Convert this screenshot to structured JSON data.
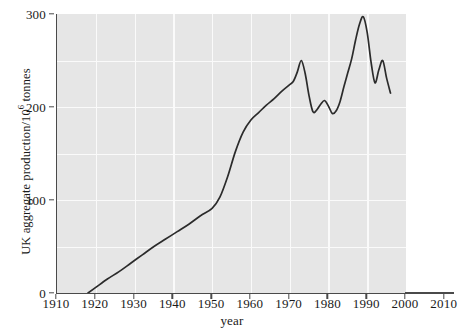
{
  "chart_data": {
    "type": "line",
    "title": "",
    "xlabel": "year",
    "ylabel": "UK aggregate production/10^6 tonnes",
    "ylabel_base": "UK aggregate production/10",
    "ylabel_exponent": "6",
    "ylabel_unit": " tonnes",
    "xlim": [
      1910,
      2010
    ],
    "ylim": [
      0,
      300
    ],
    "xticks": [
      1910,
      1920,
      1930,
      1940,
      1950,
      1960,
      1970,
      1980,
      1990,
      2000,
      2010
    ],
    "xtick_labels": [
      "1910",
      "1920",
      "1930",
      "1940",
      "1950",
      "1960",
      "1970",
      "1980",
      "1990",
      "2000",
      "2010"
    ],
    "yticks": [
      0,
      100,
      200,
      300
    ],
    "ytick_labels": [
      "0",
      "100",
      "200",
      "300"
    ],
    "y_gridlines": [
      50,
      100,
      150,
      200,
      250
    ],
    "x_gridlines": [
      1920,
      1930,
      1940,
      1950,
      1960,
      1970,
      1980,
      1990
    ],
    "plot_box_xrange": [
      1910,
      2000
    ],
    "grid": true,
    "legend": "none",
    "line_color": "#2b2b2b",
    "plot_background": "#e6e6e6",
    "gridline_color": "#fafafa",
    "axis_color": "#4a4a4a",
    "series": [
      {
        "name": "UK aggregate production",
        "x": [
          1918,
          1920,
          1923,
          1926,
          1929,
          1932,
          1935,
          1938,
          1941,
          1944,
          1947,
          1950,
          1952,
          1954,
          1956,
          1958,
          1960,
          1962,
          1964,
          1966,
          1968,
          1970,
          1971,
          1972,
          1973,
          1974,
          1975,
          1976,
          1977,
          1978,
          1979,
          1980,
          1981,
          1982,
          1983,
          1984,
          1985,
          1986,
          1987,
          1988,
          1989,
          1990,
          1991,
          1992,
          1993,
          1994,
          1995,
          1996
        ],
        "y": [
          0,
          6,
          15,
          23,
          32,
          41,
          50,
          58,
          66,
          74,
          83,
          91,
          103,
          125,
          152,
          173,
          186,
          194,
          202,
          209,
          217,
          224,
          228,
          238,
          250,
          236,
          212,
          195,
          197,
          203,
          207,
          201,
          193,
          196,
          206,
          222,
          237,
          252,
          272,
          289,
          297,
          280,
          248,
          226,
          240,
          250,
          231,
          215
        ],
        "start_year": 1918,
        "end_year": 1996,
        "peak_year": 1989,
        "peak_value": 297
      }
    ]
  }
}
